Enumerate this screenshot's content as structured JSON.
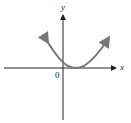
{
  "diagram": {
    "type": "function-graph",
    "axes": {
      "x_label": "x",
      "y_label": "y",
      "origin_label": "0"
    },
    "curve": {
      "shape": "parabola",
      "color": "#777777",
      "vertex_position": "slightly right of origin, on x-axis",
      "ends": "arrows at both ends"
    },
    "axis_color": "#222222"
  }
}
